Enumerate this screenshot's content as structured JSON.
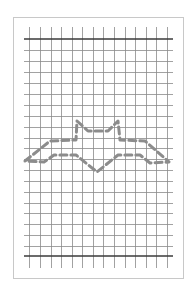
{
  "figure": {
    "frame": {
      "x": 13,
      "y": 17,
      "width": 170,
      "height": 261,
      "color": "#c8c8c8"
    },
    "grid": {
      "left": 24,
      "right": 173,
      "top_line_y": 39,
      "bottom_line_y": 256,
      "v_extend_top": 27,
      "v_extend_bottom": 268,
      "v_lines_x": [
        29,
        40,
        51,
        61,
        72,
        82,
        93,
        103,
        114,
        125,
        135,
        146,
        156,
        167
      ],
      "h_lines_y": [
        50,
        61,
        72,
        83,
        94,
        105,
        116,
        127,
        138,
        148,
        159,
        170,
        181,
        192,
        203,
        213,
        224,
        235,
        246
      ],
      "line_color": "#8a8a8a",
      "bold_line_color": "#3a3a3a"
    },
    "outline": {
      "stroke": "#8c8c8c",
      "stroke_width": 3,
      "dash": "7 4",
      "points": [
        [
          77,
          121
        ],
        [
          88,
          131
        ],
        [
          108,
          131
        ],
        [
          118,
          121
        ],
        [
          120,
          140
        ],
        [
          145,
          141
        ],
        [
          169,
          162
        ],
        [
          150,
          163
        ],
        [
          140,
          155
        ],
        [
          118,
          155
        ],
        [
          97,
          172
        ],
        [
          76,
          155
        ],
        [
          54,
          155
        ],
        [
          44,
          162
        ],
        [
          25,
          161
        ],
        [
          50,
          141
        ],
        [
          76,
          140
        ],
        [
          77,
          121
        ]
      ]
    }
  }
}
